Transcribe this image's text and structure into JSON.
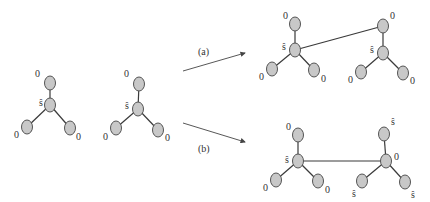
{
  "diagram": {
    "colors": {
      "node_fill": "#c8c8c8",
      "node_stroke": "#555555",
      "edge": "#3a3a3a"
    },
    "input_trees": [
      {
        "id": "T1",
        "nodes": [
          {
            "id": "c",
            "x": 50,
            "y": 105,
            "label": "ŝ",
            "lx": 39,
            "ly": 106
          },
          {
            "id": "t",
            "x": 50,
            "y": 83,
            "label": "0",
            "lx": 35,
            "ly": 77
          },
          {
            "id": "l",
            "x": 27,
            "y": 127,
            "label": "0",
            "lx": 14,
            "ly": 138
          },
          {
            "id": "r",
            "x": 70,
            "y": 128,
            "label": "0",
            "lx": 76,
            "ly": 140
          }
        ],
        "edges": [
          [
            "c",
            "t"
          ],
          [
            "c",
            "l"
          ],
          [
            "c",
            "r"
          ]
        ]
      },
      {
        "id": "T2",
        "nodes": [
          {
            "id": "c",
            "x": 138,
            "y": 109,
            "label": "ŝ",
            "lx": 125,
            "ly": 109
          },
          {
            "id": "t",
            "x": 139,
            "y": 84,
            "label": "0",
            "lx": 124,
            "ly": 77
          },
          {
            "id": "l",
            "x": 116,
            "y": 128,
            "label": "0",
            "lx": 103,
            "ly": 140
          },
          {
            "id": "r",
            "x": 158,
            "y": 130,
            "label": "0",
            "lx": 165,
            "ly": 141
          }
        ],
        "edges": [
          [
            "c",
            "t"
          ],
          [
            "c",
            "l"
          ],
          [
            "c",
            "r"
          ]
        ]
      }
    ],
    "operations": [
      {
        "label": "(a)",
        "arrow": {
          "x1": 183,
          "y1": 71,
          "x2": 245,
          "y2": 53
        },
        "label_pos": {
          "x": 198,
          "y": 55
        },
        "result": {
          "nodes": [
            {
              "id": "ac",
              "x": 295,
              "y": 50,
              "label": "ŝ",
              "lx": 282,
              "ly": 50
            },
            {
              "id": "at",
              "x": 295,
              "y": 24,
              "label": "0",
              "lx": 283,
              "ly": 19
            },
            {
              "id": "al",
              "x": 272,
              "y": 69,
              "label": "0",
              "lx": 259,
              "ly": 80
            },
            {
              "id": "ar",
              "x": 314,
              "y": 70,
              "label": "0",
              "lx": 321,
              "ly": 82
            },
            {
              "id": "bc",
              "x": 383,
              "y": 53,
              "label": "ŝ",
              "lx": 370,
              "ly": 53
            },
            {
              "id": "bt",
              "x": 383,
              "y": 26,
              "label": "0",
              "lx": 390,
              "ly": 19
            },
            {
              "id": "bl",
              "x": 361,
              "y": 72,
              "label": "0",
              "lx": 348,
              "ly": 83
            },
            {
              "id": "br",
              "x": 403,
              "y": 73,
              "label": "0",
              "lx": 410,
              "ly": 84
            }
          ],
          "edges": [
            [
              "ac",
              "at"
            ],
            [
              "ac",
              "al"
            ],
            [
              "ac",
              "ar"
            ],
            [
              "bc",
              "bt"
            ],
            [
              "bc",
              "bl"
            ],
            [
              "bc",
              "br"
            ],
            [
              "ac",
              "bt"
            ]
          ]
        }
      },
      {
        "label": "(b)",
        "arrow": {
          "x1": 183,
          "y1": 123,
          "x2": 245,
          "y2": 142
        },
        "label_pos": {
          "x": 198,
          "y": 152
        },
        "result": {
          "nodes": [
            {
              "id": "cc",
              "x": 298,
              "y": 161,
              "label": "ŝ",
              "lx": 285,
              "ly": 163
            },
            {
              "id": "ct",
              "x": 298,
              "y": 135,
              "label": "0",
              "lx": 286,
              "ly": 130
            },
            {
              "id": "cl",
              "x": 276,
              "y": 180,
              "label": "0",
              "lx": 263,
              "ly": 191
            },
            {
              "id": "cr",
              "x": 318,
              "y": 181,
              "label": "0",
              "lx": 325,
              "ly": 193
            },
            {
              "id": "dc",
              "x": 386,
              "y": 161,
              "label": "0",
              "lx": 394,
              "ly": 160
            },
            {
              "id": "dt",
              "x": 384,
              "y": 134,
              "label": "ŝ",
              "lx": 391,
              "ly": 125
            },
            {
              "id": "dl",
              "x": 362,
              "y": 181,
              "label": "ŝ",
              "lx": 352,
              "ly": 197
            },
            {
              "id": "dr",
              "x": 405,
              "y": 182,
              "label": "ŝ",
              "lx": 411,
              "ly": 198
            }
          ],
          "edges": [
            [
              "cc",
              "ct"
            ],
            [
              "cc",
              "cl"
            ],
            [
              "cc",
              "cr"
            ],
            [
              "dc",
              "dt"
            ],
            [
              "dc",
              "dl"
            ],
            [
              "dc",
              "dr"
            ],
            [
              "cc",
              "dc"
            ]
          ]
        }
      }
    ]
  }
}
